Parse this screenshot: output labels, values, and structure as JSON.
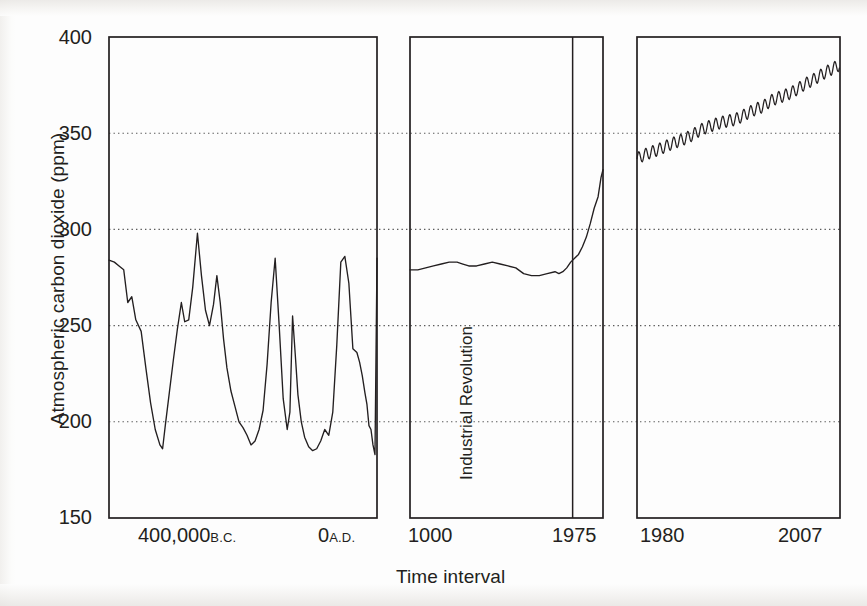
{
  "figure": {
    "y_axis_title": "Atmospheric carbon dioxide (ppm)",
    "x_axis_title": "Time interval",
    "annotation": "Industrial Revolution"
  },
  "y_ticks": [
    {
      "label": "400",
      "value": 400
    },
    {
      "label": "350",
      "value": 350
    },
    {
      "label": "300",
      "value": 300
    },
    {
      "label": "250",
      "value": 250
    },
    {
      "label": "200",
      "value": 200
    },
    {
      "label": "150",
      "value": 150
    }
  ],
  "x_ticks": {
    "panel1_left_num": "400,000",
    "panel1_left_era": "B.C.",
    "panel1_right_num": "0",
    "panel1_right_era": "A.D.",
    "panel2_left": "1000",
    "panel2_right": "1975",
    "panel3_left": "1980",
    "panel3_right": "2007"
  },
  "chart_data": {
    "type": "line",
    "title": "",
    "xlabel": "Time interval",
    "ylabel": "Atmospheric carbon dioxide (ppm)",
    "ylim": [
      150,
      400
    ],
    "yticks": [
      150,
      200,
      250,
      300,
      350,
      400
    ],
    "grid": "horizontal dotted at 200, 250, 300, 350",
    "legend": "none",
    "panels": [
      {
        "name": "ice-core-record",
        "xlabel_left": "400,000 B.C.",
        "xlabel_right": "0 A.D.",
        "xlim": [
          -400000,
          0
        ],
        "description": "Glacial-interglacial cycles from ice cores; sawtooth between about 183 and 298 ppm",
        "x": [
          -400000,
          -392000,
          -385000,
          -378000,
          -372000,
          -366000,
          -360000,
          -352000,
          -345000,
          -338000,
          -331000,
          -324000,
          -320000,
          -316000,
          -310000,
          -304000,
          -298000,
          -292000,
          -287000,
          -281000,
          -275000,
          -268000,
          -262000,
          -256000,
          -250000,
          -244000,
          -239000,
          -234000,
          -229000,
          -224000,
          -218000,
          -212000,
          -206000,
          -200000,
          -194000,
          -188000,
          -182000,
          -176000,
          -170000,
          -164000,
          -158000,
          -152000,
          -146000,
          -140000,
          -134000,
          -130000,
          -126000,
          -122000,
          -118000,
          -113000,
          -108000,
          -102000,
          -96000,
          -90000,
          -84000,
          -78000,
          -72000,
          -66000,
          -60000,
          -54000,
          -48000,
          -42000,
          -36000,
          -30000,
          -26000,
          -22000,
          -18000,
          -15000,
          -12000,
          -9000,
          -6000,
          -3000,
          0
        ],
        "y": [
          284,
          283,
          281,
          279,
          262,
          265,
          253,
          247,
          228,
          210,
          196,
          188,
          186,
          198,
          215,
          232,
          248,
          262,
          252,
          253,
          270,
          298,
          276,
          258,
          250,
          261,
          276,
          262,
          243,
          228,
          216,
          208,
          200,
          197,
          193,
          188,
          190,
          196,
          206,
          230,
          262,
          285,
          250,
          212,
          196,
          205,
          255,
          235,
          214,
          200,
          192,
          187,
          185,
          186,
          190,
          196,
          193,
          205,
          240,
          283,
          286,
          272,
          238,
          236,
          231,
          224,
          215,
          209,
          198,
          196,
          188,
          183,
          285
        ]
      },
      {
        "name": "last-millennium",
        "xlabel_left": "1000",
        "xlabel_right": "1975",
        "xlim": [
          1000,
          1985
        ],
        "annotation": "Industrial Revolution",
        "annotation_x": 1830,
        "description": "Flat near 280 ppm until the Industrial Revolution, then sharp rise to about 330 ppm",
        "x": [
          1000,
          1040,
          1080,
          1120,
          1160,
          1200,
          1240,
          1270,
          1300,
          1340,
          1380,
          1420,
          1460,
          1500,
          1540,
          1580,
          1620,
          1660,
          1700,
          1740,
          1760,
          1780,
          1800,
          1820,
          1840,
          1860,
          1880,
          1900,
          1920,
          1940,
          1960,
          1975,
          1985
        ],
        "y": [
          279,
          279,
          280,
          281,
          282,
          283,
          283,
          282,
          281,
          281,
          282,
          283,
          282,
          281,
          280,
          277,
          276,
          276,
          277,
          278,
          277,
          278,
          280,
          283,
          285,
          287,
          291,
          296,
          303,
          311,
          317,
          327,
          331
        ]
      },
      {
        "name": "keeling-curve",
        "xlabel_left": "1980",
        "xlabel_right": "2007",
        "xlim": [
          1979,
          2008
        ],
        "description": "Mauna Loa record rising from about 337 to 385 ppm with an annual seasonal oscillation of roughly 6 ppm peak-to-peak",
        "start_value": 337,
        "end_value": 385,
        "seasonal_amplitude": 3.1,
        "x": [
          1979,
          1980,
          1981,
          1982,
          1983,
          1984,
          1985,
          1986,
          1987,
          1988,
          1989,
          1990,
          1991,
          1992,
          1993,
          1994,
          1995,
          1996,
          1997,
          1998,
          1999,
          2000,
          2001,
          2002,
          2003,
          2004,
          2005,
          2006,
          2007,
          2008
        ],
        "y": [
          336.8,
          338.7,
          340.1,
          341.4,
          343.0,
          344.6,
          346.0,
          347.4,
          349.2,
          351.6,
          353.1,
          354.4,
          355.6,
          356.4,
          357.1,
          358.8,
          360.8,
          362.6,
          363.8,
          366.6,
          368.3,
          369.5,
          371.0,
          373.1,
          375.6,
          377.4,
          379.6,
          381.8,
          383.7,
          385.6
        ]
      }
    ]
  }
}
